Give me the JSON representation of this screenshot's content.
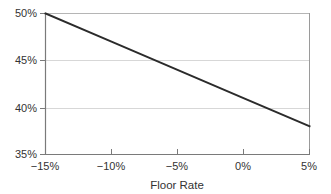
{
  "chart_data": {
    "type": "line",
    "title": "",
    "subtitle": "",
    "xlabel": "Floor Rate",
    "ylabel": "",
    "xlim": [
      -15,
      5
    ],
    "ylim": [
      35,
      50
    ],
    "grid": true,
    "legend": null,
    "x_tick_labels": [
      "−15%",
      "−10%",
      "−5%",
      "0%",
      "5%"
    ],
    "x_ticks": [
      -15,
      -10,
      -5,
      0,
      5
    ],
    "y_tick_labels": [
      "35%",
      "40%",
      "45%",
      "50%"
    ],
    "y_ticks": [
      35,
      40,
      45,
      50
    ],
    "series": [
      {
        "name": "series-1",
        "color": "#2b2b2b",
        "x": [
          -15,
          -10,
          -5,
          0,
          5
        ],
        "values": [
          50,
          47,
          44,
          41,
          38
        ]
      }
    ],
    "annotations": []
  },
  "axes": {
    "x_title": "Floor Rate",
    "y_title": ""
  },
  "style": {
    "line_color": "#2b2b2b",
    "grid_color": "#d0d0d0",
    "axis_color": "#808080",
    "text_color": "#333333",
    "background": "#ffffff"
  }
}
